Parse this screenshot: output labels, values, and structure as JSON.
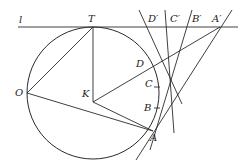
{
  "diagram": {
    "type": "geometry-construction",
    "labels": {
      "l": "l",
      "T": "T",
      "O": "O",
      "K": "K",
      "A": "A",
      "B": "B",
      "C": "C",
      "D": "D",
      "A_prime": "A′",
      "B_prime": "B′",
      "C_prime": "C′",
      "D_prime": "D′"
    },
    "points": {
      "T": [
        93,
        27
      ],
      "O": [
        27,
        93
      ],
      "K": [
        93,
        102
      ],
      "A": [
        153,
        131
      ],
      "B": [
        157,
        108
      ],
      "C": [
        157,
        87
      ],
      "D": [
        152,
        67
      ],
      "A_prime": [
        220,
        27
      ],
      "B_prime": [
        188,
        27
      ],
      "C_prime": [
        168,
        27
      ],
      "D_prime": [
        146,
        27
      ]
    },
    "circle": {
      "cx": 93,
      "cy": 93,
      "r": 66
    },
    "colors": {
      "stroke": "#2a2a2a",
      "background": "#ffffff"
    }
  }
}
